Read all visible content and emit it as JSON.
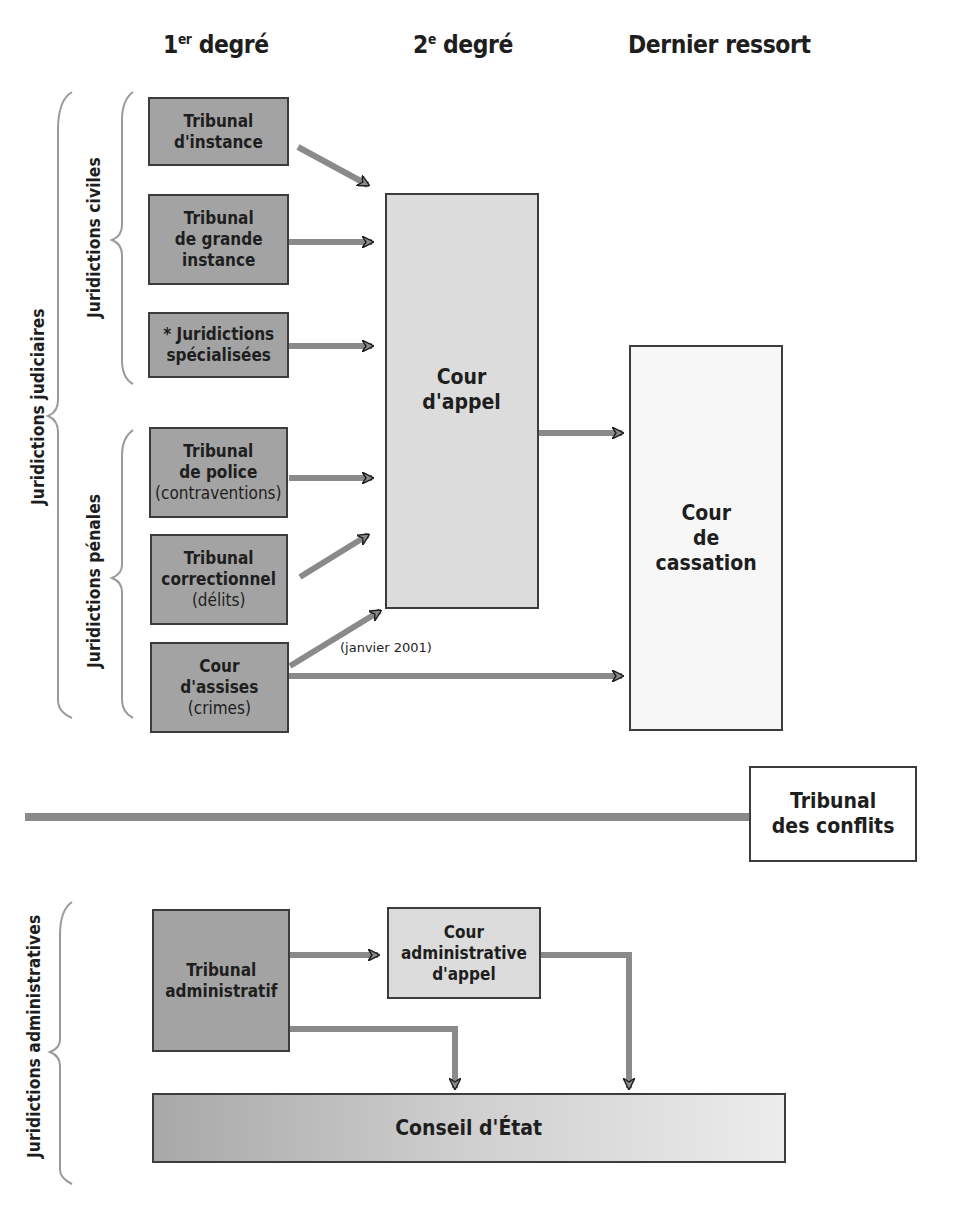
{
  "columns": {
    "first": {
      "main": "1",
      "sup": "er",
      "rest": " degré"
    },
    "second": {
      "main": "2",
      "sup": "e",
      "rest": " degré"
    },
    "last": "Dernier ressort"
  },
  "groups": {
    "judiciaires": "Juridictions judiciaires",
    "civiles": "Juridictions civiles",
    "penales": "Juridictions pénales",
    "administratives": "Juridictions administratives"
  },
  "civil_courts": [
    {
      "line1": "Tribunal",
      "line2": "d'instance",
      "line3": ""
    },
    {
      "line1": "Tribunal",
      "line2": "de grande",
      "line3": "instance"
    },
    {
      "line1": "* Juridictions",
      "line2": "spécialisées",
      "line3": ""
    }
  ],
  "penal_courts": [
    {
      "line1": "Tribunal",
      "line2": "de police",
      "sub": "(contraventions)"
    },
    {
      "line1": "Tribunal",
      "line2": "correctionnel",
      "sub": "(délits)"
    },
    {
      "line1": "Cour",
      "line2": "d'assises",
      "sub": "(crimes)"
    }
  ],
  "cour_appel": {
    "line1": "Cour",
    "line2": "d'appel"
  },
  "cour_cassation": {
    "line1": "Cour",
    "line2": "de",
    "line3": "cassation"
  },
  "assises_note": "(janvier 2001)",
  "tribunal_conflits": {
    "line1": "Tribunal",
    "line2": "des conflits"
  },
  "admin": {
    "tribunal": {
      "line1": "Tribunal",
      "line2": "administratif"
    },
    "cour_appel": {
      "line1": "Cour",
      "line2": "administrative",
      "line3": "d'appel"
    },
    "conseil": "Conseil d'État"
  },
  "colors": {
    "dark_box": "#a3a3a3",
    "light_box": "#dcdcdc",
    "arrow": "#8a8a8a",
    "border": "#3c3c3c"
  }
}
